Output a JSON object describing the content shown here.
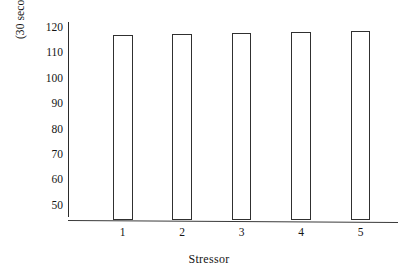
{
  "chart_data": {
    "type": "bar",
    "title": "",
    "subtitle": "",
    "xlabel": "Stressor",
    "ylabel": "(30 second heart rate)",
    "categories": [
      "1",
      "2",
      "3",
      "4",
      "5"
    ],
    "values": [
      117,
      117.3,
      117.6,
      118,
      118.4
    ],
    "series": [
      {
        "name": "30 second heart rate",
        "values": [
          117,
          117.3,
          117.6,
          118,
          118.4
        ]
      }
    ],
    "ylim": [
      44,
      122
    ],
    "ytick_labels": [
      "50",
      "60",
      "70",
      "80",
      "90",
      "100",
      "110",
      "120"
    ],
    "ytick_values": [
      50,
      60,
      70,
      80,
      90,
      100,
      110,
      120
    ],
    "xtick_labels": [
      "1",
      "2",
      "3",
      "4",
      "5"
    ],
    "grid": false,
    "legend": false,
    "legend_position": "none",
    "bar_style": "outline",
    "bar_fill_color": "#ffffff",
    "bar_edge_color": "#303030",
    "axis_color": "#2b2b2b",
    "background_color": "#ffffff",
    "annotations": []
  }
}
